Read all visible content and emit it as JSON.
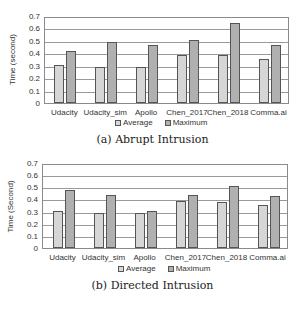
{
  "chart_data": [
    {
      "type": "bar",
      "title": "(a) Abrupt Intrusion",
      "xlabel": "",
      "ylabel": "Time (second)",
      "ylim": [
        0,
        0.7
      ],
      "yticks": [
        "0",
        "0.1",
        "0.2",
        "0.3",
        "0.4",
        "0.5",
        "0.6",
        "0.7"
      ],
      "grid": true,
      "legend_position": "bottom",
      "categories": [
        "Udacity",
        "Udacity_sim",
        "Apollo",
        "Chen_2017",
        "Chen_2018",
        "Comma.ai"
      ],
      "series": [
        {
          "name": "Average",
          "values": [
            0.31,
            0.29,
            0.29,
            0.39,
            0.39,
            0.36
          ]
        },
        {
          "name": "Maximum",
          "values": [
            0.42,
            0.5,
            0.47,
            0.51,
            0.65,
            0.47
          ]
        }
      ]
    },
    {
      "type": "bar",
      "title": "(b) Directed Intrusion",
      "xlabel": "",
      "ylabel": "Time (Second)",
      "ylim": [
        0,
        0.7
      ],
      "yticks": [
        "0",
        "0.1",
        "0.2",
        "0.3",
        "0.4",
        "0.5",
        "0.6",
        "0.7"
      ],
      "grid": true,
      "legend_position": "bottom",
      "categories": [
        "Udacity",
        "Udacity_sim",
        "Apollo",
        "Chen_2017",
        "Chen_2018",
        "Comma.ai"
      ],
      "series": [
        {
          "name": "Average",
          "values": [
            0.31,
            0.29,
            0.29,
            0.39,
            0.38,
            0.36
          ]
        },
        {
          "name": "Maximum",
          "values": [
            0.48,
            0.44,
            0.31,
            0.44,
            0.52,
            0.43
          ]
        }
      ]
    }
  ],
  "colors": {
    "average_fill": "#d6d6d6",
    "maximum_fill": "#f2f2f2",
    "maximum_dots": "#8c8c8c",
    "border": "#555555",
    "grid": "#9a9a9a"
  }
}
